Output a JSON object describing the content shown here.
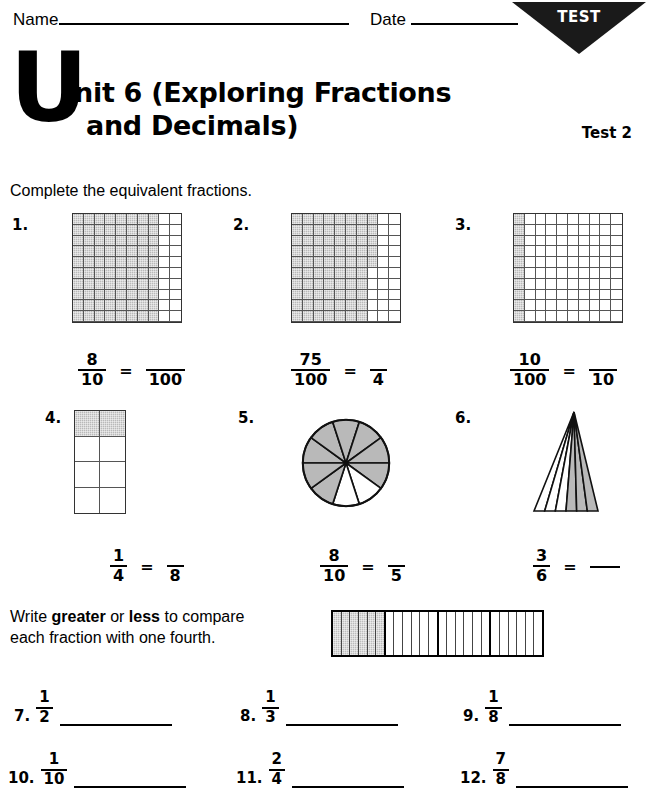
{
  "header": {
    "name_label": "Name",
    "date_label": "Date",
    "badge_text": "TEST",
    "title_drop_cap": "U",
    "title_line1": "nit 6 (Exploring Fractions",
    "title_line2": "and Decimals)",
    "test_number": "Test 2"
  },
  "sections": {
    "equivalent_instruction": "Complete the equivalent fractions.",
    "compare_instruction_parts": {
      "a": "Write ",
      "b": "greater",
      "c": " or ",
      "d": "less",
      "e": " to compare",
      "f": "each fraction with one fourth."
    }
  },
  "equivalent_problems": [
    {
      "number": "1.",
      "figure": "grid-10x10",
      "shaded_cells": 80,
      "left_fraction": {
        "numerator": "8",
        "denominator": "10"
      },
      "equals": "=",
      "right_fraction": {
        "numerator": "",
        "denominator": "100"
      }
    },
    {
      "number": "2.",
      "figure": "grid-10x10",
      "shaded_cells": 75,
      "left_fraction": {
        "numerator": "75",
        "denominator": "100"
      },
      "equals": "=",
      "right_fraction": {
        "numerator": "",
        "denominator": "4"
      }
    },
    {
      "number": "3.",
      "figure": "grid-10x10",
      "shaded_cells": 10,
      "left_fraction": {
        "numerator": "10",
        "denominator": "100"
      },
      "equals": "=",
      "right_fraction": {
        "numerator": "",
        "denominator": "10"
      }
    },
    {
      "number": "4.",
      "figure": "grid-2x4",
      "shaded_cells": 2,
      "left_fraction": {
        "numerator": "1",
        "denominator": "4"
      },
      "equals": "=",
      "right_fraction": {
        "numerator": "",
        "denominator": "8"
      }
    },
    {
      "number": "5.",
      "figure": "pie-10-sectors",
      "shaded_sectors": 8,
      "total_sectors": 10,
      "left_fraction": {
        "numerator": "8",
        "denominator": "10"
      },
      "equals": "=",
      "right_fraction": {
        "numerator": "",
        "denominator": "5"
      }
    },
    {
      "number": "6.",
      "figure": "triangle-6-wedges",
      "shaded_wedges": 3,
      "total_wedges": 6,
      "left_fraction": {
        "numerator": "3",
        "denominator": "6"
      },
      "equals": "=",
      "right_fraction": {
        "numerator": "",
        "denominator": ""
      }
    }
  ],
  "bar_figure": {
    "quarters": 4,
    "strips_per_quarter": 6,
    "shaded_quarters": 1
  },
  "compare_problems": [
    {
      "number": "7.",
      "numerator": "1",
      "denominator": "2",
      "answer": ""
    },
    {
      "number": "8.",
      "numerator": "1",
      "denominator": "3",
      "answer": ""
    },
    {
      "number": "9.",
      "numerator": "1",
      "denominator": "8",
      "answer": ""
    },
    {
      "number": "10.",
      "numerator": "1",
      "denominator": "10",
      "answer": ""
    },
    {
      "number": "11.",
      "numerator": "2",
      "denominator": "4",
      "answer": ""
    },
    {
      "number": "12.",
      "numerator": "7",
      "denominator": "8",
      "answer": ""
    }
  ],
  "colors": {
    "shade_gray": "#b9b9b9",
    "ink": "#000000",
    "badge_fill": "#1a1a1a"
  }
}
